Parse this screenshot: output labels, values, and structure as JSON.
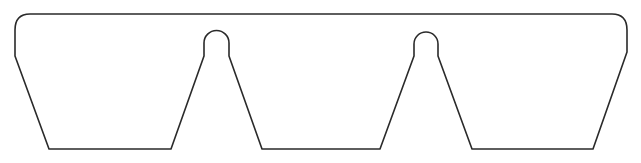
{
  "diagram": {
    "stroke_color": "#2a2a2a",
    "background_color": "#ffffff",
    "stroke_width": 1.6
  }
}
